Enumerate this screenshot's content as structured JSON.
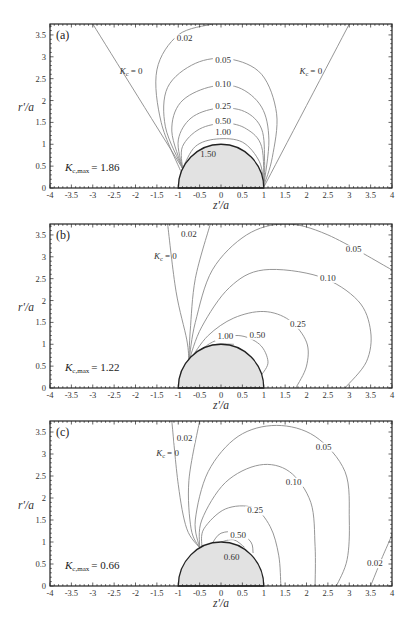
{
  "chart_data": [
    {
      "type": "contour",
      "panel": "(a)",
      "xlabel": "z'/a",
      "ylabel": "r'/a",
      "xlim": [
        -4,
        4
      ],
      "ylim": [
        0,
        3.75
      ],
      "xticks": [
        "-4",
        "-3.5",
        "-3",
        "-2.5",
        "-2",
        "-1.5",
        "-1",
        "-0.5",
        "0",
        "0.5",
        "1",
        "1.5",
        "2",
        "2.5",
        "3",
        "3.5",
        "4"
      ],
      "yticks": [
        "0",
        "0.5",
        "1",
        "1.5",
        "2",
        "2.5",
        "3",
        "3.5"
      ],
      "annotation": "K_c,max = 1.86",
      "kmax_value": "1.86",
      "sphere": {
        "center": [
          0,
          0
        ],
        "radius": 1
      },
      "contour_levels": [
        "0",
        "0.02",
        "0.05",
        "0.10",
        "0.25",
        "0.50",
        "1.00",
        "1.50"
      ],
      "labels": [
        {
          "text": "0.02",
          "x": -0.85,
          "y": 3.35
        },
        {
          "text": "0.05",
          "x": 0.05,
          "y": 2.85
        },
        {
          "text": "0.10",
          "x": 0.05,
          "y": 2.3
        },
        {
          "text": "0.25",
          "x": 0.05,
          "y": 1.8
        },
        {
          "text": "0.50",
          "x": 0.05,
          "y": 1.47
        },
        {
          "text": "1.00",
          "x": 0.05,
          "y": 1.22
        },
        {
          "text": "1.50",
          "x": -0.3,
          "y": 0.7
        },
        {
          "text": "K_c = 0",
          "x": -2.1,
          "y": 2.6
        },
        {
          "text": "K_c = 0",
          "x": 2.1,
          "y": 2.6
        }
      ],
      "series": [
        {
          "name": "K_c = 0 (left)",
          "points": [
            [
              -0.9,
              0.45
            ],
            [
              -3.0,
              3.75
            ]
          ]
        },
        {
          "name": "K_c = 0 (right)",
          "points": [
            [
              1.0,
              0.02
            ],
            [
              3.0,
              3.75
            ]
          ]
        },
        {
          "name": "0.02",
          "points": [
            [
              -0.95,
              0.4
            ],
            [
              -1.4,
              1.5
            ],
            [
              -1.5,
              2.7
            ],
            [
              -1.0,
              3.5
            ],
            [
              -0.2,
              3.75
            ]
          ]
        },
        {
          "name": "0.05",
          "points": [
            [
              -0.9,
              0.45
            ],
            [
              -1.3,
              1.4
            ],
            [
              -1.25,
              2.3
            ],
            [
              -0.6,
              2.85
            ],
            [
              0.2,
              2.95
            ],
            [
              0.95,
              2.6
            ],
            [
              1.3,
              1.7
            ],
            [
              1.2,
              0.7
            ],
            [
              1.0,
              0.05
            ]
          ]
        },
        {
          "name": "0.10",
          "points": [
            [
              -0.9,
              0.45
            ],
            [
              -1.15,
              1.3
            ],
            [
              -0.95,
              1.95
            ],
            [
              -0.3,
              2.3
            ],
            [
              0.4,
              2.3
            ],
            [
              0.95,
              1.85
            ],
            [
              1.12,
              1.1
            ],
            [
              1.0,
              0.05
            ]
          ]
        },
        {
          "name": "0.25",
          "points": [
            [
              -0.9,
              0.45
            ],
            [
              -1.0,
              1.1
            ],
            [
              -0.7,
              1.6
            ],
            [
              -0.1,
              1.82
            ],
            [
              0.55,
              1.75
            ],
            [
              0.95,
              1.35
            ],
            [
              1.02,
              0.6
            ],
            [
              1.0,
              0.05
            ]
          ]
        },
        {
          "name": "0.50",
          "points": [
            [
              -0.9,
              0.45
            ],
            [
              -0.9,
              0.95
            ],
            [
              -0.5,
              1.35
            ],
            [
              0.1,
              1.48
            ],
            [
              0.6,
              1.35
            ],
            [
              0.95,
              0.95
            ],
            [
              1.0,
              0.05
            ]
          ]
        },
        {
          "name": "1.00",
          "points": [
            [
              -0.9,
              0.45
            ],
            [
              -0.6,
              0.95
            ],
            [
              -0.1,
              1.12
            ],
            [
              0.5,
              1.05
            ],
            [
              0.9,
              0.6
            ],
            [
              1.0,
              0.05
            ]
          ]
        }
      ]
    },
    {
      "type": "contour",
      "panel": "(b)",
      "xlabel": "z'/a",
      "ylabel": "r'/a",
      "xlim": [
        -4,
        4
      ],
      "ylim": [
        0,
        3.75
      ],
      "xticks": [
        "-4",
        "-3.5",
        "-3",
        "-2.5",
        "-2",
        "-1.5",
        "-1",
        "-0.5",
        "0",
        "0.5",
        "1",
        "1.5",
        "2",
        "2.5",
        "3",
        "3.5",
        "4"
      ],
      "yticks": [
        "0",
        "0.5",
        "1",
        "1.5",
        "2",
        "2.5",
        "3",
        "3.5"
      ],
      "annotation": "K_c,max = 1.22",
      "kmax_value": "1.22",
      "sphere": {
        "center": [
          0,
          0
        ],
        "radius": 1
      },
      "contour_levels": [
        "0",
        "0.02",
        "0.05",
        "0.10",
        "0.25",
        "0.50",
        "1.00"
      ],
      "labels": [
        {
          "text": "0.02",
          "x": -0.75,
          "y": 3.45
        },
        {
          "text": "0.05",
          "x": 3.1,
          "y": 3.1
        },
        {
          "text": "0.10",
          "x": 2.5,
          "y": 2.45
        },
        {
          "text": "0.25",
          "x": 1.8,
          "y": 1.4
        },
        {
          "text": "0.50",
          "x": 0.85,
          "y": 1.15
        },
        {
          "text": "1.00",
          "x": 0.1,
          "y": 1.12
        },
        {
          "text": "K_c = 0",
          "x": -1.3,
          "y": 2.95
        }
      ],
      "series": [
        {
          "name": "K_c = 0",
          "points": [
            [
              -0.75,
              0.62
            ],
            [
              -0.8,
              1.1
            ],
            [
              -1.05,
              2.2
            ],
            [
              -1.25,
              3.75
            ]
          ]
        },
        {
          "name": "0.02",
          "points": [
            [
              -0.75,
              0.62
            ],
            [
              -0.72,
              1.3
            ],
            [
              -0.6,
              2.5
            ],
            [
              -0.25,
              3.75
            ]
          ]
        },
        {
          "name": "0.05",
          "points": [
            [
              -0.75,
              0.62
            ],
            [
              -0.6,
              1.5
            ],
            [
              -0.2,
              2.7
            ],
            [
              0.6,
              3.5
            ],
            [
              1.5,
              3.75
            ],
            [
              2.5,
              3.5
            ],
            [
              4.0,
              2.7
            ]
          ]
        },
        {
          "name": "0.10",
          "points": [
            [
              -0.75,
              0.62
            ],
            [
              -0.45,
              1.4
            ],
            [
              0.2,
              2.3
            ],
            [
              1.0,
              2.7
            ],
            [
              2.3,
              2.55
            ],
            [
              3.2,
              2.0
            ],
            [
              3.5,
              1.3
            ],
            [
              3.4,
              0.6
            ],
            [
              2.9,
              0.0
            ]
          ]
        },
        {
          "name": "0.25",
          "points": [
            [
              -0.72,
              0.65
            ],
            [
              -0.3,
              1.2
            ],
            [
              0.3,
              1.6
            ],
            [
              1.0,
              1.75
            ],
            [
              1.6,
              1.55
            ],
            [
              2.0,
              1.05
            ],
            [
              2.0,
              0.5
            ],
            [
              1.75,
              0.0
            ]
          ]
        },
        {
          "name": "0.50",
          "points": [
            [
              -0.7,
              0.68
            ],
            [
              -0.2,
              1.05
            ],
            [
              0.4,
              1.2
            ],
            [
              0.9,
              1.0
            ],
            [
              1.1,
              0.6
            ],
            [
              0.95,
              0.3
            ]
          ]
        },
        {
          "name": "1.00",
          "points": [
            [
              -0.7,
              0.7
            ],
            [
              -0.2,
              0.98
            ],
            [
              0.3,
              1.0
            ]
          ]
        }
      ]
    },
    {
      "type": "contour",
      "panel": "(c)",
      "xlabel": "z'/a",
      "ylabel": "r'/a",
      "xlim": [
        -4,
        4
      ],
      "ylim": [
        0,
        3.75
      ],
      "xticks": [
        "-4",
        "-3.5",
        "-3",
        "-2.5",
        "-2",
        "-1.5",
        "-1",
        "-0.5",
        "0",
        "0.5",
        "1",
        "1.5",
        "2",
        "2.5",
        "3",
        "3.5",
        "4"
      ],
      "yticks": [
        "0",
        "0.5",
        "1",
        "1.5",
        "2",
        "2.5",
        "3",
        "3.5"
      ],
      "annotation": "K_c,max = 0.66",
      "kmax_value": "0.66",
      "sphere": {
        "center": [
          0,
          0
        ],
        "radius": 1
      },
      "contour_levels": [
        "0",
        "0.02",
        "0.05",
        "0.10",
        "0.25",
        "0.50",
        "0.60"
      ],
      "labels": [
        {
          "text": "0.02",
          "x": -0.85,
          "y": 3.3
        },
        {
          "text": "0.02",
          "x": 3.6,
          "y": 0.45
        },
        {
          "text": "0.05",
          "x": 2.4,
          "y": 3.1
        },
        {
          "text": "0.10",
          "x": 1.7,
          "y": 2.3
        },
        {
          "text": "0.25",
          "x": 0.8,
          "y": 1.65
        },
        {
          "text": "0.50",
          "x": 0.4,
          "y": 1.1
        },
        {
          "text": "0.60",
          "x": 0.25,
          "y": 0.6
        },
        {
          "text": "K_c = 0",
          "x": -1.25,
          "y": 2.95
        }
      ],
      "series": [
        {
          "name": "K_c = 0",
          "points": [
            [
              -0.5,
              0.87
            ],
            [
              -0.8,
              1.3
            ],
            [
              -1.0,
              2.3
            ],
            [
              -1.15,
              3.75
            ]
          ]
        },
        {
          "name": "0.02 (left)",
          "points": [
            [
              -0.5,
              0.87
            ],
            [
              -0.7,
              1.3
            ],
            [
              -0.75,
              2.4
            ],
            [
              -0.5,
              3.75
            ]
          ]
        },
        {
          "name": "0.02 (right)",
          "points": [
            [
              3.5,
              0.0
            ],
            [
              3.75,
              0.6
            ],
            [
              3.95,
              1.05
            ],
            [
              4.0,
              1.2
            ]
          ]
        },
        {
          "name": "0.05",
          "points": [
            [
              -0.5,
              0.87
            ],
            [
              -0.6,
              1.5
            ],
            [
              -0.3,
              2.6
            ],
            [
              0.4,
              3.4
            ],
            [
              1.3,
              3.65
            ],
            [
              2.2,
              3.4
            ],
            [
              2.9,
              2.6
            ],
            [
              3.0,
              1.5
            ],
            [
              2.95,
              0.6
            ],
            [
              2.7,
              0.0
            ]
          ]
        },
        {
          "name": "0.10",
          "points": [
            [
              -0.5,
              0.87
            ],
            [
              -0.45,
              1.5
            ],
            [
              0.1,
              2.35
            ],
            [
              0.9,
              2.75
            ],
            [
              1.6,
              2.6
            ],
            [
              2.1,
              1.9
            ],
            [
              2.2,
              0.9
            ],
            [
              2.2,
              0.0
            ]
          ]
        },
        {
          "name": "0.25",
          "points": [
            [
              -0.45,
              0.9
            ],
            [
              -0.4,
              1.3
            ],
            [
              0.1,
              1.75
            ],
            [
              0.75,
              1.78
            ],
            [
              1.15,
              1.35
            ],
            [
              1.35,
              0.7
            ],
            [
              1.4,
              0.0
            ]
          ]
        },
        {
          "name": "0.50",
          "points": [
            [
              -0.2,
              0.98
            ],
            [
              0.0,
              1.2
            ],
            [
              0.4,
              1.22
            ],
            [
              0.7,
              1.0
            ],
            [
              0.75,
              0.75
            ]
          ]
        },
        {
          "name": "0.60",
          "points": [
            [
              0.0,
              1.0
            ],
            [
              0.3,
              1.05
            ],
            [
              0.55,
              0.88
            ]
          ]
        }
      ]
    }
  ],
  "figure": {
    "panels": [
      {
        "label": "(a)",
        "kmax_symbol": "K",
        "kmax_subscript": "c,max",
        "kmax_value": "= 1.86",
        "kc0_symbol": "K",
        "kc0_subscript": "c",
        "kc0_value": "= 0"
      },
      {
        "label": "(b)",
        "kmax_symbol": "K",
        "kmax_subscript": "c,max",
        "kmax_value": "= 1.22",
        "kc0_symbol": "K",
        "kc0_subscript": "c",
        "kc0_value": "= 0"
      },
      {
        "label": "(c)",
        "kmax_symbol": "K",
        "kmax_subscript": "c,max",
        "kmax_value": "= 0.66",
        "kc0_symbol": "K",
        "kc0_subscript": "c",
        "kc0_value": "= 0"
      }
    ],
    "xlabel": "z'/a",
    "ylabel": "r'/a",
    "colors": {
      "contour": "#8a8a8a",
      "sphere_fill": "#e2e2e2",
      "sphere_edge": "#222222",
      "axis": "#222222"
    }
  }
}
